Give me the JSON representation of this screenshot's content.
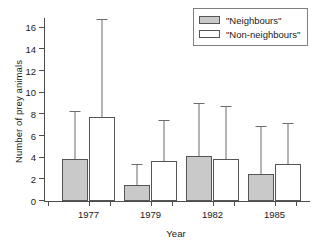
{
  "chart_data": {
    "type": "bar",
    "title": "",
    "xlabel": "Year",
    "ylabel": "Number of prey animals",
    "categories": [
      "1977",
      "1979",
      "1982",
      "1985"
    ],
    "ylim": [
      0,
      17
    ],
    "yticks": [
      0,
      2,
      4,
      6,
      8,
      10,
      12,
      14,
      16
    ],
    "ytick_labels": [
      "0",
      "2",
      "4",
      "6",
      "8",
      "10",
      "12",
      "14",
      "16"
    ],
    "grid": false,
    "legend_position": "top-right",
    "error_bars": "upper-only",
    "series": [
      {
        "name": "\"Neighbours\"",
        "color": "#c9c9c9",
        "values": [
          3.9,
          1.5,
          4.2,
          2.5
        ],
        "error_upper": [
          8.2,
          3.3,
          9.0,
          6.8
        ]
      },
      {
        "name": "\"Non-neighbours\"",
        "color": "#ffffff",
        "values": [
          7.8,
          3.7,
          3.9,
          3.4
        ],
        "error_upper": [
          16.7,
          7.4,
          8.7,
          7.1
        ]
      }
    ]
  },
  "legend": {
    "items": [
      {
        "label": "\"Neighbours\""
      },
      {
        "label": "\"Non-neighbours\""
      }
    ]
  }
}
